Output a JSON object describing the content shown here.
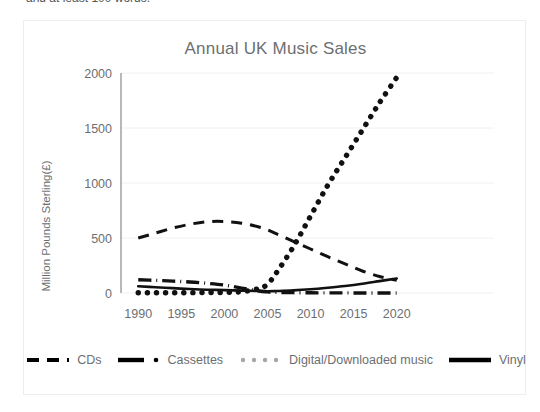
{
  "page": {
    "top_cut_text": "and at least 100 words."
  },
  "chart_card": {
    "title": "Annual UK Music Sales"
  },
  "legend": {
    "items": [
      {
        "label": "CDs",
        "marker": "dashed-line-icon",
        "color": "#000000"
      },
      {
        "label": "Cassettes",
        "marker": "dash-dot-line-icon",
        "color": "#000000"
      },
      {
        "label": "Digital/Downloaded music",
        "marker": "dotted-line-icon",
        "color": "#a6a6a6"
      },
      {
        "label": "Vinyl",
        "marker": "solid-line-icon",
        "color": "#000000"
      }
    ]
  },
  "chart_data": {
    "type": "line",
    "title": "Annual UK Music Sales",
    "xlabel": "",
    "ylabel": "Million Pounds Sterling(£)",
    "xlim": [
      1988,
      2022
    ],
    "ylim": [
      0,
      2000
    ],
    "yticks": [
      0,
      500,
      1000,
      1500,
      2000
    ],
    "xticks": [
      1990,
      1995,
      2000,
      2005,
      2010,
      2015,
      2020
    ],
    "grid": "horizontal",
    "legend_position": "bottom",
    "x": [
      1990,
      1992,
      1994,
      1996,
      1998,
      2000,
      2002,
      2004,
      2005,
      2006,
      2008,
      2010,
      2012,
      2014,
      2016,
      2018,
      2020
    ],
    "series": [
      {
        "name": "CDs",
        "style": "dashed",
        "color": "#000000",
        "values": [
          500,
          545,
          590,
          625,
          648,
          650,
          635,
          600,
          575,
          540,
          470,
          400,
          330,
          265,
          200,
          150,
          115
        ]
      },
      {
        "name": "Cassettes",
        "style": "dash-dot",
        "color": "#000000",
        "values": [
          120,
          115,
          108,
          100,
          88,
          72,
          45,
          18,
          10,
          6,
          3,
          2,
          1,
          1,
          0,
          0,
          0
        ]
      },
      {
        "name": "Digital/Downloaded music",
        "style": "dotted",
        "color": "#000000",
        "values": [
          2,
          2,
          2,
          3,
          4,
          6,
          12,
          40,
          80,
          180,
          420,
          700,
          980,
          1230,
          1480,
          1730,
          1960
        ]
      },
      {
        "name": "Vinyl",
        "style": "solid",
        "color": "#000000",
        "values": [
          62,
          52,
          44,
          36,
          30,
          26,
          22,
          18,
          16,
          18,
          24,
          34,
          48,
          64,
          84,
          108,
          132
        ]
      }
    ]
  }
}
